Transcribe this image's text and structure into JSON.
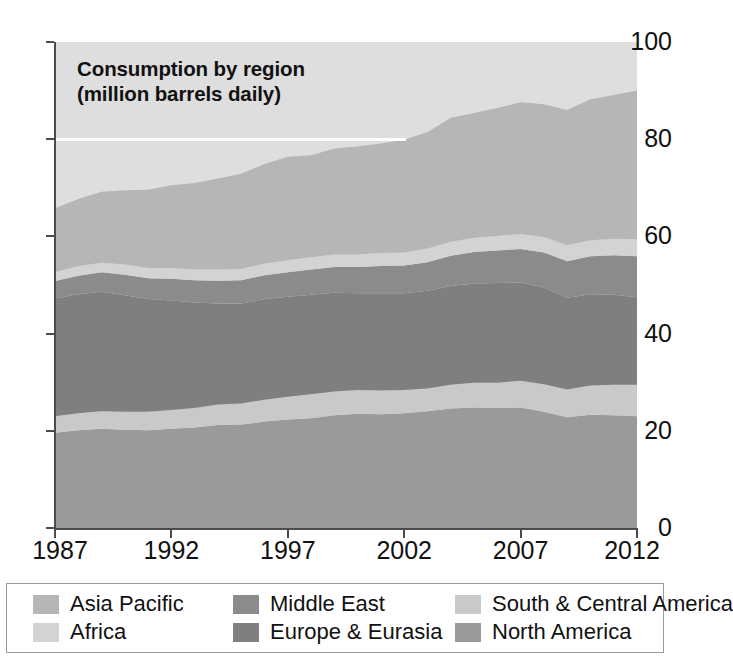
{
  "chart_data": {
    "type": "area",
    "stacked": true,
    "title": "Consumption by region\n(million barrels daily)",
    "title_line1": "Consumption by region",
    "title_line2": "(million barrels daily)",
    "xlabel": "",
    "ylabel": "",
    "xlim": [
      1987,
      2012
    ],
    "ylim": [
      0,
      100
    ],
    "ytick_values": [
      0,
      20,
      40,
      60,
      80,
      100
    ],
    "ytick_labels": [
      "0",
      "20",
      "40",
      "60",
      "80",
      "100"
    ],
    "xtick_values": [
      1987,
      1992,
      1997,
      2002,
      2007,
      2012
    ],
    "xtick_labels": [
      "1987",
      "1992",
      "1997",
      "2002",
      "2007",
      "2012"
    ],
    "grid": false,
    "gridline_highlight": 80,
    "legend_position": "below",
    "x": [
      1987,
      1988,
      1989,
      1990,
      1991,
      1992,
      1993,
      1994,
      1995,
      1996,
      1997,
      1998,
      1999,
      2000,
      2001,
      2002,
      2003,
      2004,
      2005,
      2006,
      2007,
      2008,
      2009,
      2010,
      2011,
      2012
    ],
    "series": [
      {
        "name": "North America",
        "color": "#9a9a9a",
        "values": [
          19.6,
          20.1,
          20.4,
          20.2,
          20.1,
          20.4,
          20.7,
          21.2,
          21.3,
          21.9,
          22.3,
          22.6,
          23.2,
          23.5,
          23.4,
          23.6,
          24.0,
          24.6,
          24.8,
          24.7,
          24.8,
          23.9,
          22.8,
          23.3,
          23.2,
          23.0
        ],
        "unit": "million barrels daily"
      },
      {
        "name": "South & Central America",
        "color": "#c9c9c9",
        "values": [
          3.4,
          3.5,
          3.6,
          3.7,
          3.8,
          3.9,
          4.0,
          4.2,
          4.3,
          4.5,
          4.7,
          4.9,
          4.9,
          4.9,
          4.9,
          4.8,
          4.7,
          4.9,
          5.1,
          5.2,
          5.5,
          5.7,
          5.7,
          6.0,
          6.3,
          6.5
        ],
        "unit": "million barrels daily"
      },
      {
        "name": "Europe & Eurasia",
        "color": "#7f7f7f",
        "values": [
          24.2,
          24.5,
          24.6,
          24.0,
          23.2,
          22.5,
          21.7,
          20.8,
          20.6,
          20.7,
          20.6,
          20.5,
          20.3,
          19.9,
          20.0,
          19.9,
          20.1,
          20.3,
          20.4,
          20.5,
          20.2,
          19.9,
          18.9,
          18.8,
          18.5,
          18.0
        ],
        "unit": "million barrels daily"
      },
      {
        "name": "Middle East",
        "color": "#8b8b8b",
        "values": [
          3.6,
          3.8,
          4.0,
          4.2,
          4.3,
          4.5,
          4.6,
          4.7,
          4.8,
          4.9,
          5.0,
          5.2,
          5.3,
          5.4,
          5.6,
          5.7,
          5.9,
          6.2,
          6.5,
          6.7,
          6.9,
          7.2,
          7.5,
          7.8,
          8.1,
          8.4
        ],
        "unit": "million barrels daily"
      },
      {
        "name": "Africa",
        "color": "#d3d3d3",
        "values": [
          1.9,
          2.0,
          2.0,
          2.1,
          2.1,
          2.2,
          2.2,
          2.3,
          2.3,
          2.4,
          2.5,
          2.5,
          2.6,
          2.6,
          2.7,
          2.7,
          2.8,
          2.9,
          2.9,
          3.0,
          3.1,
          3.2,
          3.3,
          3.3,
          3.4,
          3.5
        ],
        "unit": "million barrels daily"
      },
      {
        "name": "Asia Pacific",
        "color": "#b6b6b6",
        "values": [
          13.1,
          13.8,
          14.6,
          15.3,
          16.1,
          17.0,
          17.8,
          18.7,
          19.6,
          20.5,
          21.3,
          21.0,
          21.8,
          22.2,
          22.5,
          23.2,
          24.0,
          25.5,
          25.7,
          26.3,
          27.1,
          27.3,
          27.8,
          29.0,
          29.6,
          30.6
        ],
        "unit": "million barrels daily"
      }
    ],
    "totals": [
      65.8,
      67.7,
      69.2,
      69.5,
      69.6,
      70.5,
      71.0,
      71.9,
      72.9,
      74.9,
      76.4,
      76.7,
      78.1,
      78.5,
      79.1,
      79.9,
      81.5,
      84.4,
      85.4,
      86.4,
      87.6,
      87.2,
      86.0,
      88.2,
      89.1,
      90.0
    ]
  },
  "legend": {
    "items": [
      {
        "label": "Asia Pacific",
        "color": "#b6b6b6"
      },
      {
        "label": "Middle East",
        "color": "#8b8b8b"
      },
      {
        "label": "South & Central America",
        "color": "#c9c9c9"
      },
      {
        "label": "Africa",
        "color": "#d3d3d3"
      },
      {
        "label": "Europe & Eurasia",
        "color": "#7f7f7f"
      },
      {
        "label": "North America",
        "color": "#9a9a9a"
      }
    ]
  },
  "style": {
    "plot_background": "#dedede",
    "axis_color": "#4c4c4c",
    "text_color": "#111111",
    "gridline_color": "#ffffff",
    "legend_border": "#9b9b9b"
  }
}
